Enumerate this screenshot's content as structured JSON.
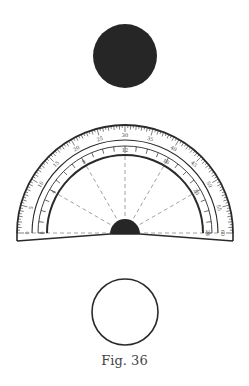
{
  "figure": {
    "caption": "Fig. 36",
    "colors": {
      "ink": "#2a2a2a",
      "fill_dark": "#262626",
      "background": "#ffffff",
      "dashed": "#8a8a8a"
    },
    "black_disk": {
      "cx": 125,
      "cy": 56,
      "r": 32
    },
    "white_circle": {
      "cx": 125,
      "cy": 312,
      "r": 33
    },
    "protractor": {
      "cx": 125,
      "cy": 233,
      "outer_radius": 108,
      "scale_ring_radius": 93,
      "inner_tick_radius": 87,
      "inner_arc_radius": 78,
      "hub_radius": 15,
      "outer_scale_labels": [
        "0",
        "5",
        "10",
        "15",
        "20",
        "25",
        "30",
        "35",
        "40",
        "45",
        "50",
        "55",
        "60"
      ],
      "inner_scale_labels": [
        "0",
        "4",
        "8",
        "12",
        "16",
        "20",
        "24"
      ],
      "spoke_count": 6
    }
  }
}
